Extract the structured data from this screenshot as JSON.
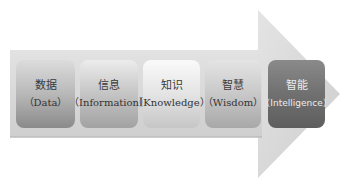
{
  "diagram": {
    "type": "process-arrow",
    "direction": "left-to-right",
    "stages": [
      {
        "zh": "数据",
        "en": "（Data）"
      },
      {
        "zh": "信息",
        "en": "（Information）"
      },
      {
        "zh": "知识",
        "en": "（Knowledge）"
      },
      {
        "zh": "智慧",
        "en": "（Wisdom）"
      },
      {
        "zh": "智能",
        "en": "（Intelligence）"
      }
    ],
    "colors": {
      "arrow_fill": "#d4d4d4",
      "highlight_stage": "#6e6e6e"
    }
  }
}
